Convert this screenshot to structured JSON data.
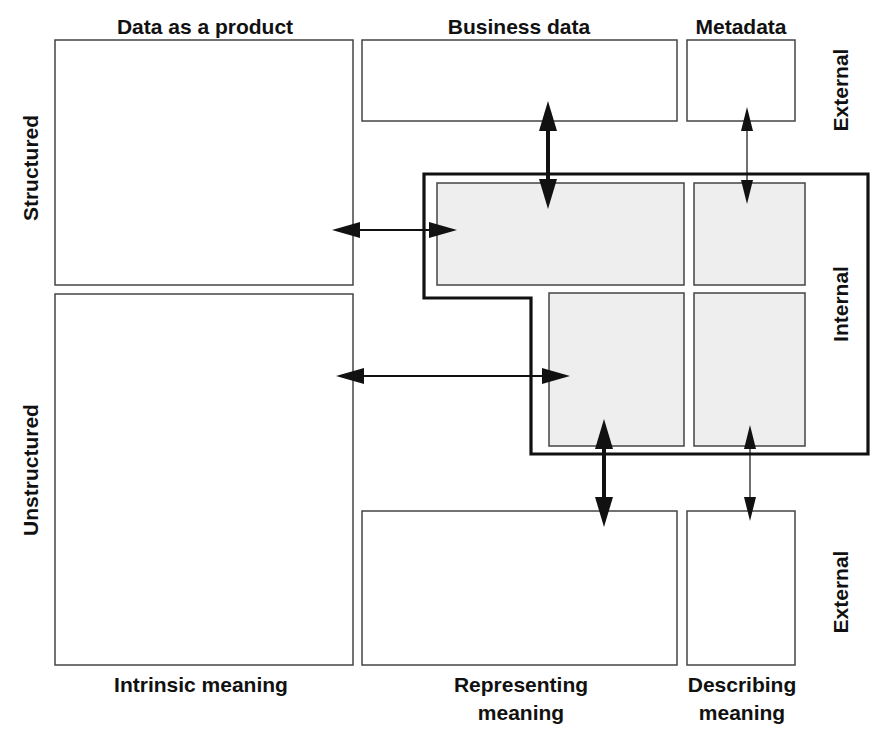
{
  "diagram": {
    "title": "",
    "column_headers": [
      {
        "id": "data-as-product",
        "label": "Data as a product",
        "x": 205,
        "y": 34
      },
      {
        "id": "business-data",
        "label": "Business data",
        "x": 519,
        "y": 34
      },
      {
        "id": "metadata",
        "label": "Metadata",
        "x": 741,
        "y": 34
      }
    ],
    "column_footers": [
      {
        "id": "intrinsic-meaning",
        "lines": [
          "Intrinsic meaning"
        ],
        "x": 201,
        "y": 692
      },
      {
        "id": "representing-meaning",
        "lines": [
          "Representing",
          "meaning"
        ],
        "x": 521,
        "y": 692
      },
      {
        "id": "describing-meaning",
        "lines": [
          "Describing",
          "meaning"
        ],
        "x": 742,
        "y": 692
      }
    ],
    "row_labels_left": [
      {
        "id": "structured",
        "label": "Structured",
        "x": 38,
        "y": 168
      },
      {
        "id": "unstructured",
        "label": "Unstructured",
        "x": 38,
        "y": 470
      }
    ],
    "row_labels_right": [
      {
        "id": "external-top",
        "label": "External",
        "x": 848,
        "y": 90
      },
      {
        "id": "internal",
        "label": "Internal",
        "x": 848,
        "y": 304
      },
      {
        "id": "external-bottom",
        "label": "External",
        "x": 848,
        "y": 592
      }
    ],
    "boxes": [
      {
        "id": "data-product-structured",
        "x": 55,
        "y": 40,
        "w": 298,
        "h": 245,
        "internal": false
      },
      {
        "id": "data-product-unstructured",
        "x": 55,
        "y": 294,
        "w": 298,
        "h": 371,
        "internal": false
      },
      {
        "id": "business-external-top",
        "x": 362,
        "y": 40,
        "w": 315,
        "h": 81,
        "internal": false
      },
      {
        "id": "metadata-external-top",
        "x": 687,
        "y": 40,
        "w": 108,
        "h": 81,
        "internal": false
      },
      {
        "id": "business-internal-structured",
        "x": 437,
        "y": 183,
        "w": 247,
        "h": 102,
        "internal": true
      },
      {
        "id": "metadata-internal-structured",
        "x": 694,
        "y": 183,
        "w": 111,
        "h": 102,
        "internal": true
      },
      {
        "id": "business-internal-unstructured",
        "x": 549,
        "y": 293,
        "w": 135,
        "h": 153,
        "internal": true
      },
      {
        "id": "metadata-internal-unstructured",
        "x": 694,
        "y": 293,
        "w": 111,
        "h": 153,
        "internal": true
      },
      {
        "id": "business-external-bottom",
        "x": 362,
        "y": 511,
        "w": 315,
        "h": 154,
        "internal": false
      },
      {
        "id": "metadata-external-bottom",
        "x": 687,
        "y": 511,
        "w": 108,
        "h": 154,
        "internal": false
      }
    ],
    "internal_region": {
      "label": "Internal",
      "points": "424,174 868,174 868,454 531,454 531,298 424,298"
    },
    "arrows": [
      {
        "id": "arrow-structured-to-internal",
        "x1": 332,
        "y1": 230,
        "x2": 457,
        "y2": 230,
        "weight": "medium"
      },
      {
        "id": "arrow-unstructured-to-internal",
        "x1": 336,
        "y1": 376,
        "x2": 570,
        "y2": 376,
        "weight": "medium"
      },
      {
        "id": "arrow-business-top",
        "x1": 548,
        "y1": 101,
        "x2": 548,
        "y2": 209,
        "weight": "thick"
      },
      {
        "id": "arrow-metadata-top",
        "x1": 747,
        "y1": 107,
        "x2": 747,
        "y2": 204,
        "weight": "thin"
      },
      {
        "id": "arrow-business-bottom",
        "x1": 604,
        "y1": 419,
        "x2": 604,
        "y2": 527,
        "weight": "thick"
      },
      {
        "id": "arrow-metadata-bottom",
        "x1": 750,
        "y1": 425,
        "x2": 750,
        "y2": 521,
        "weight": "thin"
      }
    ],
    "arrow_styles": {
      "thick": {
        "shaft": 4,
        "head_len": 30,
        "head_w": 18
      },
      "medium": {
        "shaft": 2,
        "head_len": 28,
        "head_w": 16
      },
      "thin": {
        "shaft": 1.2,
        "head_len": 24,
        "head_w": 12
      }
    },
    "colors": {
      "internal_fill": "#eeeeee",
      "box_stroke": "#444444",
      "outline_stroke": "#111111",
      "text": "#111111"
    }
  }
}
